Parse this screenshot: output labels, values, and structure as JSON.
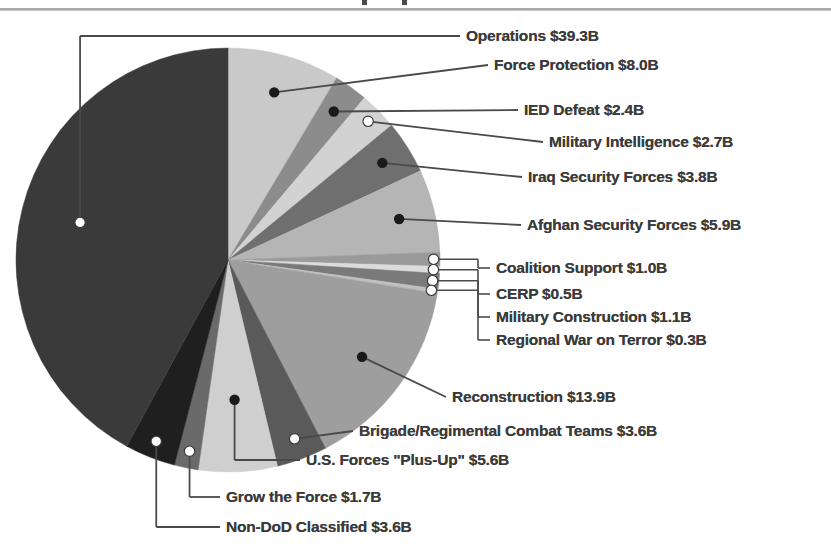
{
  "page": {
    "background": "#ffffff",
    "text_color": "#3b3b3b",
    "rule_color": "#a8a8a8"
  },
  "chart_data": {
    "type": "pie",
    "title": "",
    "units": "$B",
    "total": 99.4,
    "start_angle_deg": 0,
    "direction": "clockwise",
    "legend": "callout-labels",
    "grid": false,
    "categories": [
      "Operations",
      "Force Protection",
      "IED Defeat",
      "Military Intelligence",
      "Iraq Security Forces",
      "Afghan Security Forces",
      "Coalition Support",
      "CERP",
      "Military Construction",
      "Regional War on Terror",
      "Reconstruction",
      "Brigade/Regimental Combat Teams",
      "U.S. Forces \"Plus-Up\"",
      "Grow the Force",
      "Non-DoD Classified"
    ],
    "values": [
      39.3,
      8.0,
      2.4,
      2.7,
      3.8,
      5.9,
      1.0,
      0.5,
      1.1,
      0.3,
      13.9,
      3.6,
      5.6,
      1.7,
      3.6
    ],
    "colors": [
      "#3a3a3a",
      "#c9c9c9",
      "#8c8c8c",
      "#d2d2d2",
      "#6f6f6f",
      "#b5b5b5",
      "#9a9a9a",
      "#dcdcdc",
      "#7a7a7a",
      "#c0c0c0",
      "#9e9e9e",
      "#5a5a5a",
      "#cfcfcf",
      "#6a6a6a",
      "#1f1f1f"
    ]
  },
  "labels": [
    {
      "id": "operations",
      "text": "Operations $39.3B",
      "x": 466,
      "y": 36,
      "marker": "open"
    },
    {
      "id": "force-protection",
      "text": "Force Protection $8.0B",
      "x": 494,
      "y": 65,
      "marker": "filled"
    },
    {
      "id": "ied-defeat",
      "text": "IED Defeat $2.4B",
      "x": 524,
      "y": 110,
      "marker": "filled"
    },
    {
      "id": "military-intelligence",
      "text": "Military Intelligence $2.7B",
      "x": 549,
      "y": 142,
      "marker": "open"
    },
    {
      "id": "iraq-security-forces",
      "text": "Iraq Security Forces $3.8B",
      "x": 528,
      "y": 177,
      "marker": "filled"
    },
    {
      "id": "afghan-security-forces",
      "text": "Afghan Security Forces $5.9B",
      "x": 527,
      "y": 225,
      "marker": "filled"
    },
    {
      "id": "coalition-support",
      "text": "Coalition Support $1.0B",
      "x": 496,
      "y": 268,
      "marker": "open"
    },
    {
      "id": "cerp",
      "text": "CERP $0.5B",
      "x": 496,
      "y": 294,
      "marker": "open"
    },
    {
      "id": "military-construction",
      "text": "Military Construction $1.1B",
      "x": 496,
      "y": 317,
      "marker": "open"
    },
    {
      "id": "regional-war-on-terror",
      "text": "Regional War on Terror $0.3B",
      "x": 496,
      "y": 340,
      "marker": "open"
    },
    {
      "id": "reconstruction",
      "text": "Reconstruction $13.9B",
      "x": 452,
      "y": 397,
      "marker": "filled"
    },
    {
      "id": "brigade-combat-teams",
      "text": "Brigade/Regimental Combat Teams $3.6B",
      "x": 359,
      "y": 431,
      "marker": "open"
    },
    {
      "id": "us-forces-plus-up",
      "text": "U.S. Forces \"Plus-Up\" $5.6B",
      "x": 306,
      "y": 460,
      "marker": "filled"
    },
    {
      "id": "grow-the-force",
      "text": "Grow the Force $1.7B",
      "x": 226,
      "y": 497,
      "marker": "open"
    },
    {
      "id": "non-dod-classified",
      "text": "Non-DoD Classified $3.6B",
      "x": 226,
      "y": 527,
      "marker": "open"
    }
  ]
}
